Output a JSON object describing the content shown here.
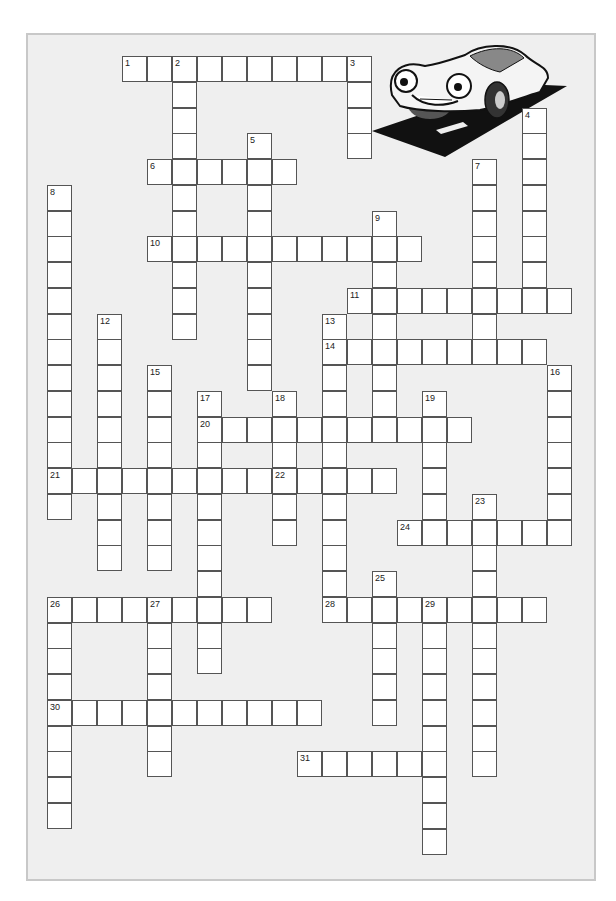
{
  "puzzle": {
    "type": "crossword",
    "illustration": "cartoon-car-on-road",
    "grid": {
      "origin_x": 22,
      "origin_y": 56,
      "cell_w": 25,
      "cell_h": 25.75
    },
    "words": [
      {
        "number": 1,
        "direction": "across",
        "row": 0,
        "col": 4,
        "length": 10
      },
      {
        "number": 2,
        "direction": "down",
        "row": 0,
        "col": 6,
        "length": 11
      },
      {
        "number": 3,
        "direction": "down",
        "row": 0,
        "col": 13,
        "length": 4
      },
      {
        "number": 4,
        "direction": "down",
        "row": 2,
        "col": 20,
        "length": 8
      },
      {
        "number": 5,
        "direction": "down",
        "row": 3,
        "col": 9,
        "length": 10
      },
      {
        "number": 6,
        "direction": "across",
        "row": 4,
        "col": 5,
        "length": 6
      },
      {
        "number": 7,
        "direction": "down",
        "row": 4,
        "col": 18,
        "length": 8
      },
      {
        "number": 8,
        "direction": "down",
        "row": 5,
        "col": 1,
        "length": 13
      },
      {
        "number": 9,
        "direction": "down",
        "row": 6,
        "col": 14,
        "length": 9
      },
      {
        "number": 10,
        "direction": "across",
        "row": 7,
        "col": 5,
        "length": 11
      },
      {
        "number": 11,
        "direction": "across",
        "row": 9,
        "col": 13,
        "length": 9
      },
      {
        "number": 12,
        "direction": "down",
        "row": 10,
        "col": 3,
        "length": 10
      },
      {
        "number": 13,
        "direction": "down",
        "row": 10,
        "col": 12,
        "length": 11
      },
      {
        "number": 14,
        "direction": "across",
        "row": 11,
        "col": 12,
        "length": 9
      },
      {
        "number": 15,
        "direction": "down",
        "row": 12,
        "col": 5,
        "length": 8
      },
      {
        "number": 16,
        "direction": "down",
        "row": 12,
        "col": 21,
        "length": 7
      },
      {
        "number": 17,
        "direction": "down",
        "row": 13,
        "col": 7,
        "length": 11
      },
      {
        "number": 18,
        "direction": "down",
        "row": 13,
        "col": 10,
        "length": 6
      },
      {
        "number": 19,
        "direction": "down",
        "row": 13,
        "col": 16,
        "length": 6
      },
      {
        "number": 20,
        "direction": "across",
        "row": 14,
        "col": 7,
        "length": 11
      },
      {
        "number": 21,
        "direction": "across",
        "row": 16,
        "col": 1,
        "length": 9
      },
      {
        "number": 22,
        "direction": "across",
        "row": 16,
        "col": 10,
        "length": 5
      },
      {
        "number": 23,
        "direction": "down",
        "row": 17,
        "col": 18,
        "length": 11
      },
      {
        "number": 24,
        "direction": "across",
        "row": 18,
        "col": 15,
        "length": 7
      },
      {
        "number": 25,
        "direction": "down",
        "row": 20,
        "col": 14,
        "length": 6
      },
      {
        "number": 26,
        "direction": "across",
        "row": 21,
        "col": 1,
        "length": 9
      },
      {
        "number": 26,
        "direction": "down",
        "row": 21,
        "col": 1,
        "length": 9
      },
      {
        "number": 27,
        "direction": "down",
        "row": 21,
        "col": 5,
        "length": 7
      },
      {
        "number": 28,
        "direction": "across",
        "row": 21,
        "col": 12,
        "length": 9
      },
      {
        "number": 29,
        "direction": "down",
        "row": 21,
        "col": 16,
        "length": 10
      },
      {
        "number": 30,
        "direction": "across",
        "row": 25,
        "col": 1,
        "length": 11
      },
      {
        "number": 31,
        "direction": "across",
        "row": 27,
        "col": 11,
        "length": 6
      }
    ]
  },
  "colors": {
    "panel_bg": "#efefef",
    "panel_border": "#c8c8c8",
    "cell_bg": "#ffffff",
    "cell_border": "#555555"
  }
}
